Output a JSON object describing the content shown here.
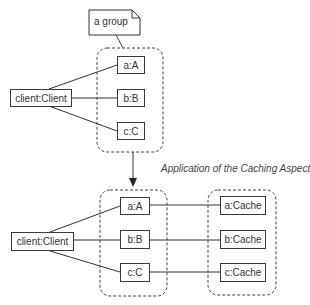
{
  "note": {
    "label": "a group"
  },
  "top": {
    "client": "client:Client",
    "objects": [
      "a:A",
      "b:B",
      "c:C"
    ]
  },
  "transition": {
    "caption": "Application of the Caching Aspect"
  },
  "bottom": {
    "client": "client:Client",
    "objects": [
      "a:A",
      "b:B",
      "c:C"
    ],
    "caches": [
      "a:Cache",
      "b:Cache",
      "c:Cache"
    ]
  },
  "colors": {
    "line": "#3a3a3a",
    "text": "#333333"
  }
}
